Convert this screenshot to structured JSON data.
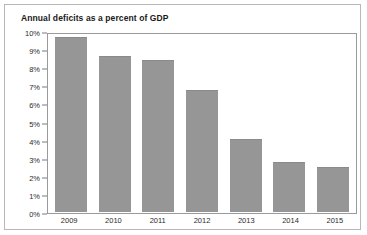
{
  "chart_data": {
    "type": "bar",
    "title": "Annual deficits as a percent of GDP",
    "xlabel": "",
    "ylabel": "",
    "categories": [
      "2009",
      "2010",
      "2011",
      "2012",
      "2013",
      "2014",
      "2015"
    ],
    "values": [
      9.8,
      8.7,
      8.5,
      6.8,
      4.1,
      2.8,
      2.5
    ],
    "ylim": [
      0,
      10
    ],
    "ytick_values": [
      0,
      1,
      2,
      3,
      4,
      5,
      6,
      7,
      8,
      9,
      10
    ],
    "ytick_labels": [
      "0%",
      "1%",
      "2%",
      "3%",
      "4%",
      "5%",
      "6%",
      "7%",
      "8%",
      "9%",
      "10%"
    ],
    "grid": false,
    "legend": null,
    "bar_color": "#969696",
    "plot_border_color": "#9a9a9a",
    "card_border_color": "#b8b8b8",
    "text_color": "#2b2b2b",
    "title_color": "#1a1a1a"
  }
}
